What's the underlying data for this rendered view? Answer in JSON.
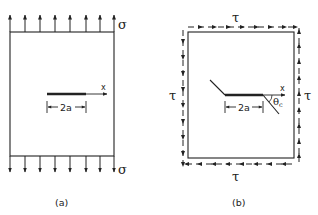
{
  "figure": {
    "panel_a": {
      "caption": "(a)",
      "load_top_label": "σ",
      "load_bottom_label": "σ",
      "axis_label": "x",
      "crack_dimension": "2a",
      "load_arrow_count": 8
    },
    "panel_b": {
      "caption": "(b)",
      "shear_top_label": "τ",
      "shear_bottom_label": "τ",
      "shear_left_label": "τ",
      "shear_right_label": "τ",
      "axis_label": "x",
      "crack_dimension": "2a",
      "angle_label": "θ",
      "angle_subscript": "c"
    },
    "colors": {
      "stroke": "#222222",
      "background": "#ffffff"
    }
  }
}
